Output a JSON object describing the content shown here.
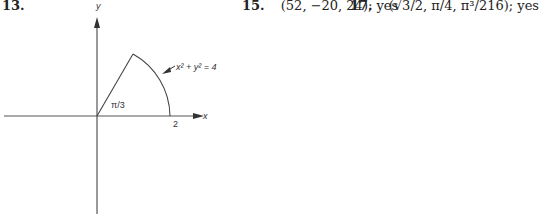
{
  "answers": [
    {
      "number": "13.",
      "text": ""
    },
    {
      "number": "15.",
      "text": "(52, −20, 24); yes"
    },
    {
      "number": "17.",
      "text": "(√3/2, π/4, π³/216); yes"
    }
  ],
  "figure": {
    "x_axis_label": "x",
    "y_axis_label": "y",
    "angle_label": "π/3",
    "x_intercept_label": "2",
    "curve_label": "x² + y² = 4"
  }
}
